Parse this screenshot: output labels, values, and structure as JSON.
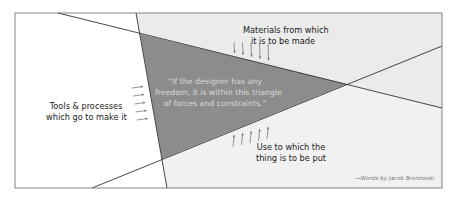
{
  "diagram": {
    "title": "Triangle of forces and constraints",
    "quote_lines": [
      "“If the designer has any",
      "freedom, it is within this triangle",
      "of forces and constraints.”"
    ],
    "forces": [
      {
        "id": "materials",
        "lines": [
          "Materials from which",
          "it is to be made"
        ],
        "arrow_direction": "down",
        "arrow_count": 5
      },
      {
        "id": "tools",
        "lines": [
          "Tools & processes",
          "which go to make it"
        ],
        "arrow_direction": "right",
        "arrow_count": 5
      },
      {
        "id": "use",
        "lines": [
          "Use to which the",
          "thing is to be put"
        ],
        "arrow_direction": "up",
        "arrow_count": 5
      }
    ],
    "credit": "—Words by Jacob Bronowski",
    "colors": {
      "triangle": "#8c8c8c",
      "region_top": "#ebebeb",
      "region_right": "#f1f1f1",
      "region_left": "#ffffff",
      "lines": "#333333",
      "arrows": "#7a7a7a"
    }
  }
}
